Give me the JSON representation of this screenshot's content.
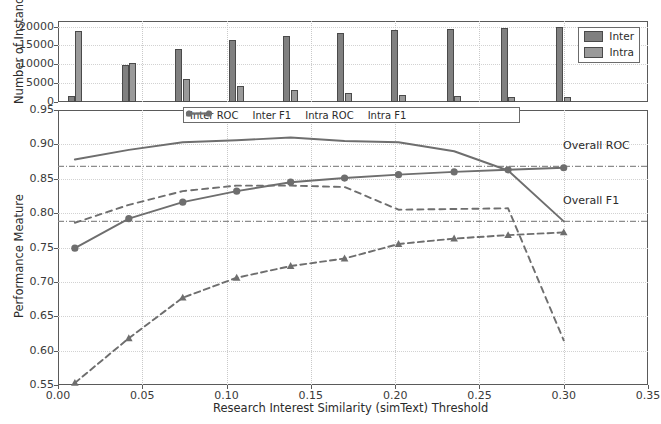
{
  "chart_data": [
    {
      "type": "bar",
      "panel": "top",
      "title": "",
      "xlabel": "",
      "ylabel": "Number of Instance",
      "ylim": [
        0,
        21500
      ],
      "yticks": [
        0,
        5000,
        10000,
        15000,
        20000
      ],
      "ytick_labels": [
        "0",
        "5000",
        "10000",
        "15000",
        "20000"
      ],
      "xlim": [
        0.0,
        0.35
      ],
      "grid": true,
      "legend_position": "upper right",
      "categories": [
        0.01,
        0.042,
        0.074,
        0.106,
        0.138,
        0.17,
        0.202,
        0.235,
        0.267,
        0.3
      ],
      "series": [
        {
          "name": "Inter",
          "color": "#808080",
          "values": [
            1500,
            9700,
            14200,
            16400,
            17600,
            18400,
            19000,
            19400,
            19700,
            20000
          ]
        },
        {
          "name": "Intra",
          "color": "#9a9a9a",
          "values": [
            18800,
            10400,
            6200,
            4300,
            3100,
            2400,
            1900,
            1600,
            1400,
            1200
          ]
        }
      ]
    },
    {
      "type": "line",
      "panel": "main",
      "title": "",
      "xlabel": "Research Interest Similarity (simText) Threshold",
      "ylabel": "Performance Meature",
      "xlim": [
        0.0,
        0.35
      ],
      "ylim": [
        0.55,
        0.95
      ],
      "xticks": [
        0.0,
        0.05,
        0.1,
        0.15,
        0.2,
        0.25,
        0.3,
        0.35
      ],
      "xtick_labels": [
        "0.00",
        "0.05",
        "0.10",
        "0.15",
        "0.20",
        "0.25",
        "0.30",
        "0.35"
      ],
      "yticks": [
        0.55,
        0.6,
        0.65,
        0.7,
        0.75,
        0.8,
        0.85,
        0.9,
        0.95
      ],
      "ytick_labels": [
        "0.55",
        "0.60",
        "0.65",
        "0.70",
        "0.75",
        "0.80",
        "0.85",
        "0.90",
        "0.95"
      ],
      "grid": true,
      "legend_position": "upper center",
      "x": [
        0.01,
        0.042,
        0.074,
        0.106,
        0.138,
        0.17,
        0.202,
        0.235,
        0.267,
        0.3
      ],
      "series": [
        {
          "name": "Inter ROC",
          "marker": "circle",
          "linestyle": "solid",
          "color": "#6e6e6e",
          "values": [
            0.749,
            0.792,
            0.816,
            0.832,
            0.845,
            0.851,
            0.856,
            0.86,
            0.863,
            0.866
          ]
        },
        {
          "name": "Inter F1",
          "marker": "triangle",
          "linestyle": "dashed",
          "color": "#6e6e6e",
          "values": [
            0.553,
            0.618,
            0.677,
            0.706,
            0.723,
            0.734,
            0.755,
            0.763,
            0.768,
            0.772
          ]
        },
        {
          "name": "Intra ROC",
          "marker": "none",
          "linestyle": "solid",
          "color": "#6e6e6e",
          "values": [
            0.878,
            0.892,
            0.903,
            0.906,
            0.91,
            0.905,
            0.903,
            0.89,
            0.862,
            0.788
          ]
        },
        {
          "name": "Intra F1",
          "marker": "none",
          "linestyle": "dashed",
          "color": "#6e6e6e",
          "values": [
            0.786,
            0.812,
            0.832,
            0.84,
            0.84,
            0.838,
            0.805,
            0.806,
            0.807,
            0.615
          ]
        }
      ],
      "reference_lines": [
        {
          "label": "Overall ROC",
          "value": 0.868,
          "linestyle": "dashdot",
          "color": "#8c8c8c"
        },
        {
          "label": "Overall F1",
          "value": 0.788,
          "linestyle": "dashdot",
          "color": "#8c8c8c"
        }
      ]
    }
  ],
  "top_panel": {
    "ylabel": "Number of Instance",
    "ytick_labels": [
      "0",
      "5000",
      "10000",
      "15000",
      "20000"
    ],
    "legend": {
      "items": [
        {
          "label": "Inter"
        },
        {
          "label": "Intra"
        }
      ]
    }
  },
  "main_panel": {
    "ylabel": "Performance Meature",
    "xlabel": "Research Interest Similarity (simText) Threshold",
    "ytick_labels": [
      "0.55",
      "0.60",
      "0.65",
      "0.70",
      "0.75",
      "0.80",
      "0.85",
      "0.90",
      "0.95"
    ],
    "xtick_labels": [
      "0.00",
      "0.05",
      "0.10",
      "0.15",
      "0.20",
      "0.25",
      "0.30",
      "0.35"
    ],
    "legend": {
      "items": [
        {
          "label": "Inter ROC"
        },
        {
          "label": "Inter F1"
        },
        {
          "label": "Intra ROC"
        },
        {
          "label": "Intra F1"
        }
      ]
    },
    "reference_labels": {
      "roc": "Overall ROC",
      "f1": "Overall F1"
    }
  },
  "colors": {
    "inter_bar": "#808080",
    "intra_bar": "#9a9a9a",
    "line": "#6e6e6e",
    "reference": "#8c8c8c",
    "axis": "#5a5a5a",
    "grid": "#c9c9c9"
  }
}
